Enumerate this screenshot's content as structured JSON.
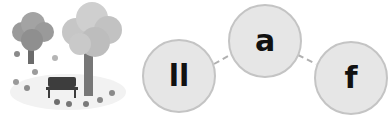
{
  "illustration": {
    "subject": "autumn-park-scene",
    "elements": [
      "tree",
      "tree",
      "bench",
      "falling-leaves"
    ]
  },
  "word_bubbles": [
    {
      "label": "ll"
    },
    {
      "label": "a"
    },
    {
      "label": "f"
    }
  ],
  "colors": {
    "bubble_fill": "#e6e6e6",
    "bubble_border": "#c4c4c4",
    "text": "#111111",
    "connector": "#b0b0b0"
  }
}
